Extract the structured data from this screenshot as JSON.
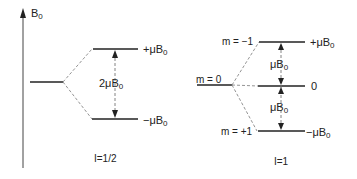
{
  "axis": {
    "label": "B",
    "label_sub": "0"
  },
  "spin_half": {
    "upper_label": "+μB",
    "upper_sub": "0",
    "lower_label": "−μB",
    "lower_sub": "0",
    "gap_label": "2μB",
    "gap_sub": "0",
    "caption": "I=1/2"
  },
  "spin_one": {
    "base_label": "m = 0",
    "upper_m_label": "m = −1",
    "lower_m_label": "m = +1",
    "upper_label": "+μB",
    "upper_sub": "0",
    "middle_label": "0",
    "lower_label": "−μB",
    "lower_sub": "0",
    "gap_upper_label": "μB",
    "gap_upper_sub": "0",
    "gap_lower_label": "μB",
    "gap_lower_sub": "0",
    "caption": "I=1"
  },
  "colors": {
    "line": "#222222",
    "dashed": "#777777"
  }
}
